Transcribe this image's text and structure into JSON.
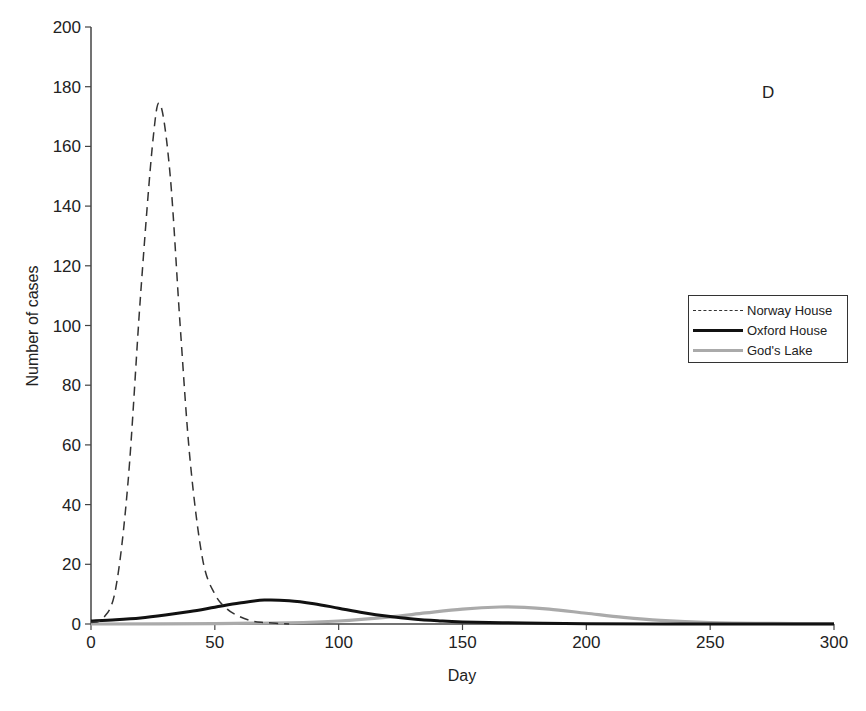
{
  "chart_data": {
    "type": "line",
    "title": "",
    "panel_label": "D",
    "xlabel": "Day",
    "ylabel": "Number of cases",
    "xlim": [
      0,
      300
    ],
    "ylim": [
      0,
      200
    ],
    "x_ticks": [
      0,
      50,
      100,
      150,
      200,
      250,
      300
    ],
    "y_ticks": [
      0,
      20,
      40,
      60,
      80,
      100,
      120,
      140,
      160,
      180,
      200
    ],
    "grid": false,
    "legend_position": "right-middle",
    "series": [
      {
        "name": "Norway House",
        "style": "dashed-then-solid",
        "color": "#222222",
        "x": [
          0,
          5,
          10,
          15,
          20,
          25,
          28,
          32,
          36,
          40,
          45,
          50,
          55,
          60,
          65,
          70,
          80
        ],
        "y": [
          0.5,
          2,
          12,
          48,
          110,
          162,
          174,
          150,
          100,
          55,
          22,
          10,
          5,
          2.5,
          1,
          0.5,
          0
        ]
      },
      {
        "name": "Oxford House",
        "style": "solid-thick",
        "color": "#111111",
        "x": [
          0,
          10,
          20,
          30,
          40,
          50,
          60,
          70,
          80,
          90,
          100,
          110,
          120,
          130,
          140,
          150,
          175,
          200,
          250,
          300
        ],
        "y": [
          1,
          1.4,
          2,
          3,
          4.2,
          5.6,
          7,
          8,
          7.8,
          6.8,
          5.3,
          3.8,
          2.6,
          1.7,
          1.1,
          0.7,
          0.3,
          0.1,
          0,
          0
        ]
      },
      {
        "name": "God's Lake",
        "style": "solid-thick-light",
        "color": "#aaaaaa",
        "x": [
          0,
          50,
          80,
          100,
          120,
          135,
          150,
          165,
          175,
          185,
          200,
          215,
          230,
          250,
          275,
          300
        ],
        "y": [
          0,
          0.1,
          0.4,
          1,
          2.3,
          3.7,
          5,
          5.7,
          5.6,
          5,
          3.6,
          2.2,
          1.2,
          0.5,
          0.2,
          0.1
        ]
      }
    ]
  }
}
